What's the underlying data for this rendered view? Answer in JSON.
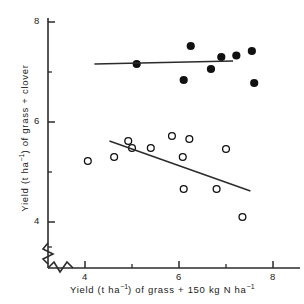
{
  "chart_data": {
    "type": "scatter",
    "title": "",
    "xlabel_parts": {
      "pre": "Yield (t ha",
      "sup1": "−1",
      "mid": ") of grass + 150 kg N ha",
      "sup2": "−1"
    },
    "ylabel_parts": {
      "pre": "Yield (t ha",
      "sup1": "−1",
      "mid": ") of grass + clover"
    },
    "xlabel": "Yield (t ha-1) of grass + 150 kg N ha-1",
    "ylabel": "Yield (t ha-1) of grass + clover",
    "xlim": [
      3.1,
      8.4
    ],
    "ylim": [
      3.35,
      8.15
    ],
    "xticks_major": [
      4,
      6,
      8
    ],
    "xticks_minor": [
      5,
      7
    ],
    "yticks_major": [
      4,
      6,
      8
    ],
    "yticks_minor": [
      5,
      7
    ],
    "xtick_labels": [
      "4",
      "6",
      "8"
    ],
    "ytick_labels": [
      "4",
      "6",
      "8"
    ],
    "grid": false,
    "axis_break": true,
    "axis_break_note": "zigzag break symbol on both axes near origin",
    "legend": null,
    "series": [
      {
        "name": "grass + 150 kg N ha-1 (filled circles)",
        "marker": "filled-circle",
        "color": "#111111",
        "points": [
          {
            "x": 5.1,
            "y": 7.16
          },
          {
            "x": 6.1,
            "y": 6.84
          },
          {
            "x": 6.25,
            "y": 7.52
          },
          {
            "x": 6.68,
            "y": 7.06
          },
          {
            "x": 6.9,
            "y": 7.3
          },
          {
            "x": 7.22,
            "y": 7.33
          },
          {
            "x": 7.55,
            "y": 7.42
          },
          {
            "x": 7.6,
            "y": 6.78
          }
        ],
        "fit_line": {
          "x1": 4.2,
          "y1": 7.16,
          "x2": 7.15,
          "y2": 7.22
        }
      },
      {
        "name": "grass + clover (open circles)",
        "marker": "open-circle",
        "color": "#111111",
        "points": [
          {
            "x": 4.06,
            "y": 5.22
          },
          {
            "x": 4.62,
            "y": 5.3
          },
          {
            "x": 4.92,
            "y": 5.62
          },
          {
            "x": 5.0,
            "y": 5.48
          },
          {
            "x": 5.4,
            "y": 5.48
          },
          {
            "x": 5.85,
            "y": 5.72
          },
          {
            "x": 6.08,
            "y": 5.3
          },
          {
            "x": 6.22,
            "y": 5.66
          },
          {
            "x": 6.1,
            "y": 4.66
          },
          {
            "x": 6.8,
            "y": 4.66
          },
          {
            "x": 7.0,
            "y": 5.46
          },
          {
            "x": 7.35,
            "y": 4.1
          }
        ],
        "fit_line": {
          "x1": 4.52,
          "y1": 5.62,
          "x2": 7.52,
          "y2": 4.62
        }
      }
    ]
  }
}
